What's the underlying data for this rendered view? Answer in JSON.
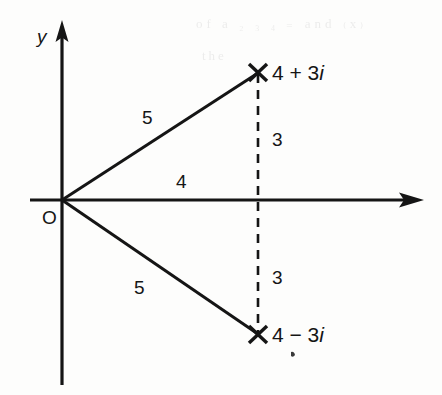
{
  "figure": {
    "kind": "argand-diagram",
    "background_color": "#fdfdfc",
    "ink_color": "#151515",
    "axis_label_y": "y",
    "origin_label": "O",
    "point_upper_label": "4 + 3i",
    "point_lower_label": "4 − 3i",
    "length_upper_hypotenuse": "5",
    "length_lower_hypotenuse": "5",
    "length_horizontal": "4",
    "length_vertical_upper": "3",
    "length_vertical_lower": "3",
    "marker_glyph": "x-cross-marker"
  },
  "bleed_text": {
    "line1": "of a  ₂  ₃  ₄  ₌  and  ₍x₎",
    "line2": "the"
  },
  "chart_data": {
    "type": "scatter",
    "title": "",
    "xlabel": "",
    "ylabel": "y",
    "xlim": [
      -1,
      6
    ],
    "ylim": [
      -5,
      5
    ],
    "grid": false,
    "legend": "none",
    "points": [
      {
        "label": "4 + 3i",
        "x": 4,
        "y": 3
      },
      {
        "label": "4 - 3i",
        "x": 4,
        "y": -3
      }
    ],
    "segments": [
      {
        "from": [
          0,
          0
        ],
        "to": [
          4,
          3
        ],
        "style": "solid",
        "annotation": "5"
      },
      {
        "from": [
          0,
          0
        ],
        "to": [
          4,
          -3
        ],
        "style": "solid",
        "annotation": "5"
      },
      {
        "from": [
          0,
          0
        ],
        "to": [
          4,
          0
        ],
        "style": "solid",
        "annotation": "4"
      },
      {
        "from": [
          4,
          3
        ],
        "to": [
          4,
          0
        ],
        "style": "dashed",
        "annotation": "3"
      },
      {
        "from": [
          4,
          0
        ],
        "to": [
          4,
          -3
        ],
        "style": "dashed",
        "annotation": "3"
      }
    ],
    "annotations": [
      {
        "text": "5",
        "x": 1.55,
        "y": 1.55
      },
      {
        "text": "5",
        "x": 1.45,
        "y": -1.35
      },
      {
        "text": "4",
        "x": 2.2,
        "y": 0.3
      },
      {
        "text": "3",
        "x": 4.35,
        "y": 1.55
      },
      {
        "text": "3",
        "x": 4.35,
        "y": -1.45
      },
      {
        "text": "O",
        "x": -0.35,
        "y": -0.4
      }
    ]
  }
}
